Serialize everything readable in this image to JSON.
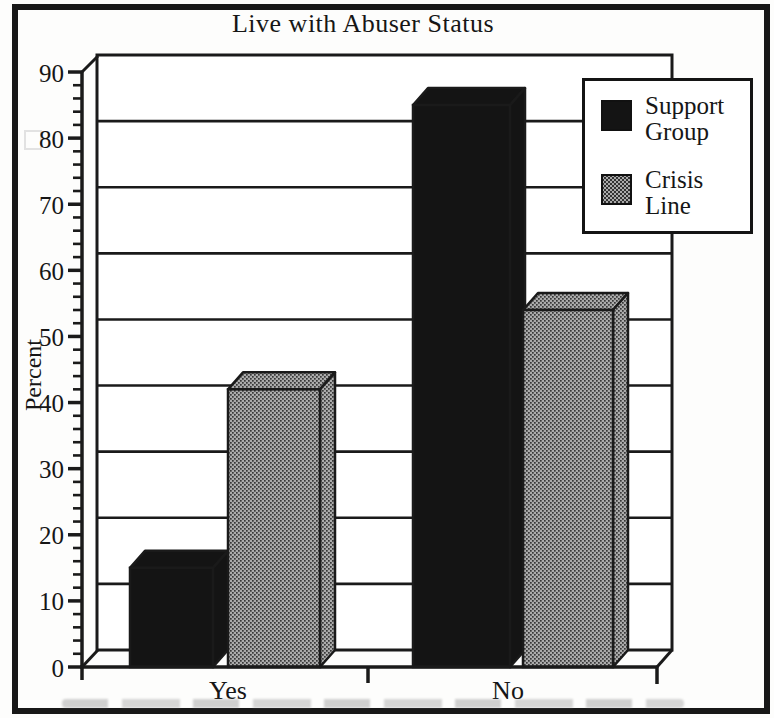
{
  "chart_data": {
    "type": "bar",
    "style": "3d-column, black-and-white scan",
    "title": "Live with Abuser Status",
    "ylabel": "Percent",
    "xlabel": "",
    "categories": [
      "Yes",
      "No"
    ],
    "series": [
      {
        "name": "Support Group",
        "color": "#141414",
        "fill": "solid-black",
        "values": [
          15,
          85
        ]
      },
      {
        "name": "Crisis Line",
        "color": "#9a9a9a",
        "fill": "stipple-gray",
        "values": [
          42,
          54
        ]
      }
    ],
    "ylim": [
      0,
      90
    ],
    "yticks": [
      0,
      10,
      20,
      30,
      40,
      50,
      60,
      70,
      80,
      90
    ],
    "ytick_step": 10,
    "minor_tick_step": 2,
    "grid": "horizontal gridlines every 10 on back wall",
    "legend_position": "top-right",
    "ink_color": "#1a1a1a"
  }
}
